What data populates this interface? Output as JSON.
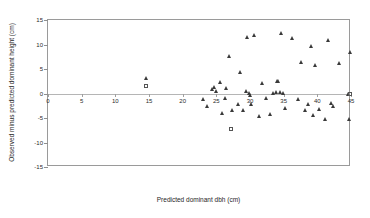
{
  "chart_data": {
    "type": "scatter",
    "title": "",
    "xlabel": "Predicted dominant dbh (cm)",
    "ylabel": "Observed minus predicted dominant height (cm)",
    "xlim": [
      0,
      45
    ],
    "ylim": [
      -15,
      15
    ],
    "xticks": [
      0,
      5,
      10,
      15,
      20,
      25,
      30,
      35,
      40,
      45
    ],
    "yticks": [
      15,
      10,
      5,
      0,
      -5,
      -10,
      -15
    ],
    "xtick_labels": [
      "0",
      "5",
      "10",
      "15",
      "20",
      "25",
      "30",
      "35",
      "40",
      "45"
    ],
    "ytick_labels": [
      "15",
      "10",
      "5",
      "0",
      "-5",
      "-10",
      "-15"
    ],
    "grid": false,
    "legend": "none",
    "reference_line_y": 0,
    "series": [
      {
        "name": "triangle",
        "marker": "triangle",
        "color": "#3a3a3a",
        "points": [
          [
            14.6,
            3.2
          ],
          [
            23.0,
            -1.2
          ],
          [
            23.6,
            -2.6
          ],
          [
            24.3,
            0.9
          ],
          [
            24.6,
            1.3
          ],
          [
            24.9,
            0.6
          ],
          [
            25.5,
            2.3
          ],
          [
            25.8,
            -4.0
          ],
          [
            26.3,
            -0.9
          ],
          [
            26.5,
            1.2
          ],
          [
            26.9,
            7.6
          ],
          [
            27.3,
            -3.4
          ],
          [
            28.2,
            -2.1
          ],
          [
            28.5,
            4.4
          ],
          [
            29.0,
            -3.3
          ],
          [
            29.4,
            0.6
          ],
          [
            29.6,
            11.6
          ],
          [
            29.8,
            0.1
          ],
          [
            30.0,
            -0.4
          ],
          [
            30.2,
            -2.1
          ],
          [
            30.6,
            12.0
          ],
          [
            31.3,
            -4.5
          ],
          [
            31.8,
            2.2
          ],
          [
            32.4,
            -1.0
          ],
          [
            32.9,
            -4.2
          ],
          [
            33.4,
            0.2
          ],
          [
            33.8,
            0.3
          ],
          [
            34.0,
            2.5
          ],
          [
            34.2,
            2.6
          ],
          [
            34.4,
            0.4
          ],
          [
            34.6,
            12.4
          ],
          [
            34.9,
            0.2
          ],
          [
            35.2,
            -2.9
          ],
          [
            36.3,
            11.3
          ],
          [
            37.2,
            -1.1
          ],
          [
            37.6,
            6.5
          ],
          [
            38.1,
            -3.4
          ],
          [
            38.6,
            -2.2
          ],
          [
            39.0,
            9.6
          ],
          [
            39.4,
            -4.4
          ],
          [
            39.7,
            5.9
          ],
          [
            40.2,
            -3.1
          ],
          [
            41.1,
            -5.2
          ],
          [
            41.6,
            11.0
          ],
          [
            42.0,
            -1.9
          ],
          [
            42.4,
            -2.6
          ],
          [
            43.2,
            6.2
          ],
          [
            44.5,
            0.0
          ],
          [
            44.7,
            -5.3
          ],
          [
            44.9,
            8.5
          ]
        ]
      },
      {
        "name": "square",
        "marker": "square",
        "color": "#555555",
        "points": [
          [
            14.6,
            1.5
          ],
          [
            27.2,
            -7.3
          ],
          [
            44.9,
            0.0
          ]
        ]
      }
    ]
  }
}
